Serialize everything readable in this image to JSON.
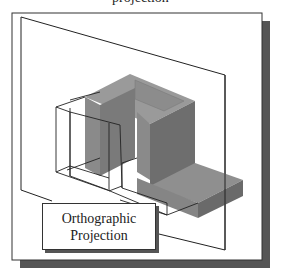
{
  "figure": {
    "top_caption_fragment": "projection",
    "label": {
      "line1": "Orthographic",
      "line2": "Projection"
    },
    "colors": {
      "frame_border": "#333333",
      "frame_shadow": "#555555",
      "block_top": "#9a9a9a",
      "block_front": "#7f7f7f",
      "block_side": "#6a6a6a",
      "wire": "#222222",
      "background": "#ffffff"
    },
    "elements": [
      "outer-frame",
      "projection-plane",
      "3d-block",
      "wireframe-projection",
      "label-box"
    ]
  }
}
